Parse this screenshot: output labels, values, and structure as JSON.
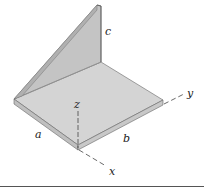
{
  "figure": {
    "type": "isometric angle bracket diagram",
    "labels": {
      "a": "a",
      "b": "b",
      "c": "c",
      "x": "x",
      "y": "y",
      "z": "z"
    },
    "axes": [
      "x",
      "y",
      "z"
    ],
    "dimensions": [
      "a",
      "b",
      "c"
    ]
  },
  "colors": {
    "plate_top": "#d4d4d4",
    "plate_edge": "#bdbdbd",
    "wall_face": "#c6c6c6",
    "wall_edge": "#a9a9a9",
    "outline": "#555555",
    "axis_line": "#444444",
    "rule": "#555555"
  }
}
